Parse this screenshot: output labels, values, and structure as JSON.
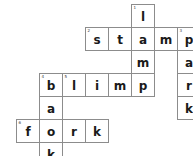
{
  "puzzle": {
    "title": "Crossword Puzzle",
    "grid_columns": 8,
    "grid_rows": 7,
    "cell_size_px": 24,
    "colors": {
      "cell_border": "#8c8c8c",
      "cell_background": "#ffffff",
      "letter": "#1a1a1a",
      "clue_number": "#3a3a3a",
      "page_background": "#ffffff"
    },
    "answers": {
      "across": [
        {
          "number": "2",
          "word": "stamp",
          "row": 1,
          "start_col": 3
        },
        {
          "number": "4",
          "word": "blimp",
          "row": 3,
          "start_col": 1
        },
        {
          "number": "6",
          "word": "fork",
          "row": 5,
          "start_col": 0
        }
      ],
      "down": [
        {
          "number": "1",
          "word": "lamp",
          "col": 5,
          "start_row": 0
        },
        {
          "number": "3",
          "word": "park",
          "col": 7,
          "start_row": 1
        },
        {
          "number": "5",
          "word": "bark",
          "col": 1,
          "start_row": 3
        }
      ]
    },
    "cells": [
      {
        "id": "cell-r0c5",
        "letter": "l",
        "number": "1",
        "col": 5,
        "row": 0
      },
      {
        "id": "cell-r1c3",
        "letter": "s",
        "number": "2",
        "col": 3,
        "row": 1
      },
      {
        "id": "cell-r1c4",
        "letter": "t",
        "number": "",
        "col": 4,
        "row": 1
      },
      {
        "id": "cell-r1c5",
        "letter": "a",
        "number": "",
        "col": 5,
        "row": 1
      },
      {
        "id": "cell-r1c6",
        "letter": "m",
        "number": "",
        "col": 6,
        "row": 1
      },
      {
        "id": "cell-r1c7",
        "letter": "p",
        "number": "3",
        "col": 7,
        "row": 1
      },
      {
        "id": "cell-r2c5",
        "letter": "m",
        "number": "",
        "col": 5,
        "row": 2
      },
      {
        "id": "cell-r2c7",
        "letter": "a",
        "number": "",
        "col": 7,
        "row": 2
      },
      {
        "id": "cell-r3c1",
        "letter": "b",
        "number": "4",
        "col": 1,
        "row": 3
      },
      {
        "id": "cell-r3c2",
        "letter": "l",
        "number": "5",
        "col": 2,
        "row": 3
      },
      {
        "id": "cell-r3c3",
        "letter": "i",
        "number": "",
        "col": 3,
        "row": 3
      },
      {
        "id": "cell-r3c4",
        "letter": "m",
        "number": "",
        "col": 4,
        "row": 3
      },
      {
        "id": "cell-r3c5",
        "letter": "p",
        "number": "",
        "col": 5,
        "row": 3
      },
      {
        "id": "cell-r3c7",
        "letter": "r",
        "number": "",
        "col": 7,
        "row": 3
      },
      {
        "id": "cell-r4c1",
        "letter": "a",
        "number": "",
        "col": 1,
        "row": 4
      },
      {
        "id": "cell-r4c7",
        "letter": "k",
        "number": "",
        "col": 7,
        "row": 4
      },
      {
        "id": "cell-r5c0",
        "letter": "f",
        "number": "6",
        "col": 0,
        "row": 5
      },
      {
        "id": "cell-r5c1",
        "letter": "o",
        "number": "",
        "col": 1,
        "row": 5
      },
      {
        "id": "cell-r5c2",
        "letter": "r",
        "number": "",
        "col": 2,
        "row": 5
      },
      {
        "id": "cell-r5c3",
        "letter": "k",
        "number": "",
        "col": 3,
        "row": 5
      },
      {
        "id": "cell-r6c1",
        "letter": "k",
        "number": "",
        "col": 1,
        "row": 6
      }
    ],
    "origin": {
      "x": 16,
      "y": 4
    }
  }
}
